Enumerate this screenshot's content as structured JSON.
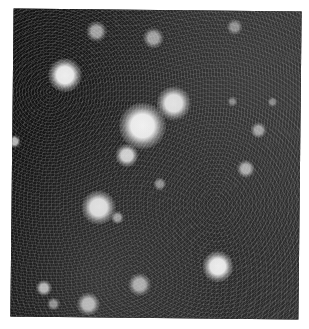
{
  "image": {
    "subject": "star field photograph",
    "palette": {
      "background": "#ffffff",
      "sky": "#1c1c1c",
      "star": "#f4f4f4"
    },
    "frame": {
      "x": 12,
      "y": 10,
      "width": 288,
      "height": 308
    },
    "stars": [
      {
        "x": 142,
        "y": 126,
        "r": 18,
        "brightness": 1.0
      },
      {
        "x": 173,
        "y": 103,
        "r": 13,
        "brightness": 0.95
      },
      {
        "x": 64,
        "y": 76,
        "r": 13,
        "brightness": 0.95
      },
      {
        "x": 99,
        "y": 208,
        "r": 13,
        "brightness": 0.97
      },
      {
        "x": 219,
        "y": 266,
        "r": 12,
        "brightness": 0.95
      },
      {
        "x": 127,
        "y": 156,
        "r": 9,
        "brightness": 0.85
      },
      {
        "x": 95,
        "y": 32,
        "r": 8,
        "brightness": 0.6
      },
      {
        "x": 152,
        "y": 38,
        "r": 8,
        "brightness": 0.6
      },
      {
        "x": 258,
        "y": 129,
        "r": 6,
        "brightness": 0.6
      },
      {
        "x": 246,
        "y": 168,
        "r": 7,
        "brightness": 0.65
      },
      {
        "x": 233,
        "y": 26,
        "r": 6,
        "brightness": 0.5
      },
      {
        "x": 141,
        "y": 285,
        "r": 9,
        "brightness": 0.7
      },
      {
        "x": 90,
        "y": 305,
        "r": 9,
        "brightness": 0.8
      },
      {
        "x": 45,
        "y": 289,
        "r": 6,
        "brightness": 0.75
      },
      {
        "x": 160,
        "y": 184,
        "r": 5,
        "brightness": 0.5
      },
      {
        "x": 118,
        "y": 218,
        "r": 5,
        "brightness": 0.6
      },
      {
        "x": 14,
        "y": 143,
        "r": 5,
        "brightness": 0.7
      },
      {
        "x": 232,
        "y": 101,
        "r": 4,
        "brightness": 0.45
      },
      {
        "x": 272,
        "y": 101,
        "r": 4,
        "brightness": 0.45
      },
      {
        "x": 55,
        "y": 305,
        "r": 5,
        "brightness": 0.55
      }
    ]
  }
}
